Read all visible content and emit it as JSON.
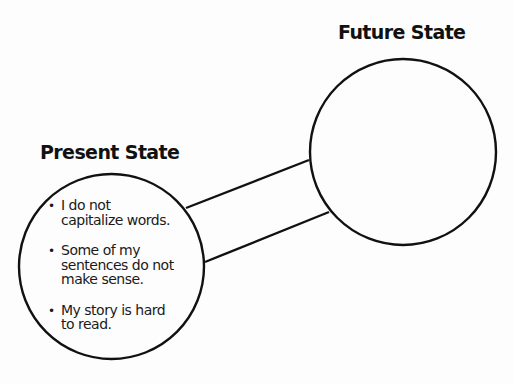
{
  "diagram": {
    "type": "present-to-future-state bridge",
    "present_state": {
      "title": "Present State",
      "items": [
        {
          "bullet": "•",
          "text": "I do not\ncapitalize words."
        },
        {
          "bullet": "•",
          "text": "Some of my\nsentences do not\nmake sense."
        },
        {
          "bullet": "•",
          "text": "My story is hard\nto read."
        }
      ]
    },
    "future_state": {
      "title": "Future State",
      "items": []
    },
    "connector": "bridge"
  },
  "colors": {
    "stroke": "#111111",
    "background": "#fdfdfd",
    "text": "#1a1a1a"
  }
}
